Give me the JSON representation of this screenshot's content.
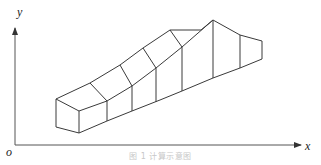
{
  "diagram": {
    "axes": {
      "x_label": "x",
      "y_label": "y",
      "origin_label": "o"
    },
    "caption": "图 1  计算示意图",
    "colors": {
      "line": "#3a3a3a",
      "caption": "#c8c8c8",
      "background": "#ffffff"
    },
    "shape": {
      "description": "3D wireframe of a sloped channel/embankment segment rising from left to right, divided into cross-section panels",
      "panels": 7
    }
  }
}
